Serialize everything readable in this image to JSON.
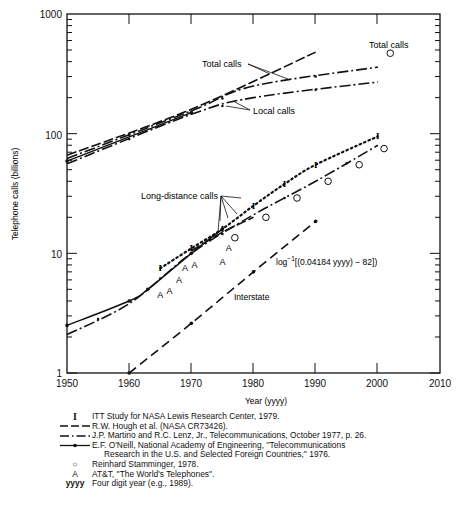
{
  "chart_data": {
    "type": "line",
    "title": "",
    "xlabel": "Year (yyyy)",
    "ylabel": "Telephone calls (billions)",
    "yscale": "log",
    "xlim": [
      1950,
      2010
    ],
    "ylim": [
      1,
      1000
    ],
    "x_ticks": [
      "1950",
      "1960",
      "1970",
      "1980",
      "1990",
      "2000",
      "2010"
    ],
    "y_ticks": [
      "1",
      "10",
      "100",
      "1000"
    ],
    "grid": false,
    "series": [
      {
        "name": "Total calls (R.W. Hough et al.)",
        "style": "long-dash",
        "x": [
          1950,
          1970,
          1990
        ],
        "values": [
          66,
          160,
          480
        ]
      },
      {
        "name": "Total calls (Martino & Lenz)",
        "style": "dash-dot",
        "x": [
          1950,
          1970,
          1980,
          2000
        ],
        "values": [
          62,
          155,
          250,
          360
        ]
      },
      {
        "name": "Local calls (Martino & Lenz)",
        "style": "dash-dot",
        "x": [
          1950,
          1970,
          1980,
          2000
        ],
        "values": [
          56,
          145,
          200,
          270
        ]
      },
      {
        "name": "Local calls (E.F. O'Neill)",
        "style": "solid-dot",
        "x": [
          1950,
          1970
        ],
        "values": [
          59,
          150
        ]
      },
      {
        "name": "Long-distance calls (ITT Study)",
        "style": "dotted-I",
        "x": [
          1965,
          1970,
          1975,
          1980,
          1985,
          1990,
          2000
        ],
        "values": [
          7.5,
          11,
          16,
          25,
          38,
          55,
          95
        ]
      },
      {
        "name": "Long-distance calls (Martino & Lenz)",
        "style": "dash-dot",
        "x": [
          1950,
          1960,
          1970,
          1980,
          1990,
          2000
        ],
        "values": [
          2.1,
          3.8,
          10,
          21,
          40,
          80
        ]
      },
      {
        "name": "Long-distance calls (E.F. O'Neill)",
        "style": "solid-dot",
        "x": [
          1950,
          1960,
          1963,
          1970,
          1975
        ],
        "values": [
          2.5,
          4,
          5,
          10,
          16
        ]
      },
      {
        "name": "Long-distance calls (R.W. Hough)",
        "style": "long-dash",
        "x": [
          1970,
          1975,
          1980
        ],
        "values": [
          10.5,
          15,
          20
        ]
      },
      {
        "name": "Interstate",
        "style": "long-dash-dot",
        "x": [
          1960,
          1970,
          1980,
          1990
        ],
        "values": [
          1,
          2.6,
          7,
          18.5
        ]
      },
      {
        "name": "Reinhard Stamminger (circles)",
        "style": "marker-circle",
        "x": [
          1977,
          1982,
          1987,
          1992,
          1997,
          2001,
          2002
        ],
        "values": [
          13.5,
          20,
          29,
          40,
          55,
          75,
          470
        ]
      },
      {
        "name": "AT&T 'The World's Telephones' (A)",
        "style": "marker-A",
        "x": [
          1965,
          1966.5,
          1968,
          1969,
          1970.5,
          1975,
          1976
        ],
        "values": [
          4.5,
          4.8,
          6,
          7.5,
          8,
          8.5,
          11
        ]
      }
    ],
    "annotations": [
      {
        "text": "Total calls",
        "near": "upper lines ~1983"
      },
      {
        "text": "Local calls",
        "near": "lower upper lines ~1985"
      },
      {
        "text": "Total calls",
        "near": "circle at 2002, 470"
      },
      {
        "text": "Long-distance calls",
        "near": "cluster ~1975"
      },
      {
        "text": "Interstate",
        "near": "dashed line ~1978"
      },
      {
        "text": "log⁻¹[(0.04184 yyyy) − 82])",
        "near": "interstate line ~1990"
      }
    ]
  },
  "axes": {
    "xlabel": "Year (yyyy)",
    "ylabel": "Telephone calls (billions)",
    "x_ticks": [
      "1950",
      "1960",
      "1970",
      "1980",
      "1990",
      "2000",
      "2010"
    ],
    "y_ticks": [
      "1",
      "10",
      "100",
      "1000"
    ]
  },
  "labels": {
    "total_calls": "Total calls",
    "local_calls": "Local calls",
    "total_calls_circle": "Total calls",
    "long_distance": "Long-distance calls",
    "interstate": "Interstate",
    "formula_prefix": "log",
    "formula_sup": "−1",
    "formula_body": "[(0.04184 yyyy)  −  82])"
  },
  "legend": [
    {
      "symbol": "I",
      "text": "ITT Study for NASA Lewis Research Center, 1979."
    },
    {
      "symbol": "long-dash",
      "text": "R.W. Hough et al. (NASA CR73426)."
    },
    {
      "symbol": "dash-dot",
      "text": "J.P. Martino and R.C. Lenz, Jr., Telecommunications, October 1977, p. 26."
    },
    {
      "symbol": "solid-dot",
      "text": "E.F. O'Neill, National Academy of Engineering, ''Telecommunications",
      "continuation": "Research in the U.S. and Selected Foreign Countries,'' 1976."
    },
    {
      "symbol": "○",
      "text": "Reinhard Stamminger, 1978."
    },
    {
      "symbol": "A",
      "text": "AT&T, ''The World's Telephones''."
    },
    {
      "symbol": "yyyy",
      "text": "Four digit year (e.g., 1989)."
    }
  ]
}
